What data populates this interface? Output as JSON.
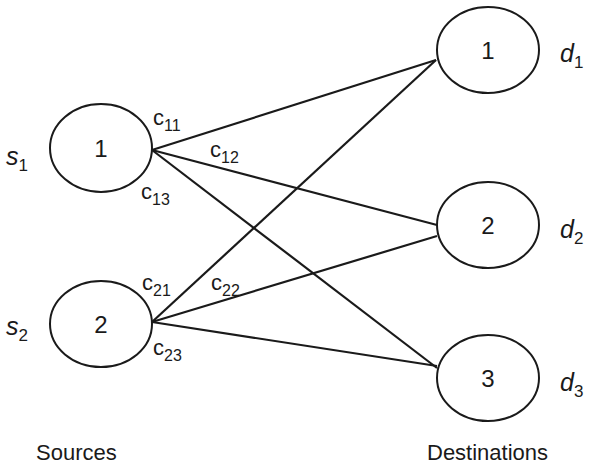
{
  "diagram": {
    "type": "transportation-network",
    "sources_caption": "Sources",
    "destinations_caption": "Destinations",
    "sources": [
      {
        "id": "1",
        "label": "1",
        "supply_symbol": "s",
        "supply_sub": "1"
      },
      {
        "id": "2",
        "label": "2",
        "supply_symbol": "s",
        "supply_sub": "2"
      }
    ],
    "destinations": [
      {
        "id": "1",
        "label": "1",
        "demand_symbol": "d",
        "demand_sub": "1"
      },
      {
        "id": "2",
        "label": "2",
        "demand_symbol": "d",
        "demand_sub": "2"
      },
      {
        "id": "3",
        "label": "3",
        "demand_symbol": "d",
        "demand_sub": "3"
      }
    ],
    "edges": [
      {
        "from": "1",
        "to": "1",
        "cost_symbol": "c",
        "cost_sub": "11"
      },
      {
        "from": "1",
        "to": "2",
        "cost_symbol": "c",
        "cost_sub": "12"
      },
      {
        "from": "1",
        "to": "3",
        "cost_symbol": "c",
        "cost_sub": "13"
      },
      {
        "from": "2",
        "to": "1",
        "cost_symbol": "c",
        "cost_sub": "21"
      },
      {
        "from": "2",
        "to": "2",
        "cost_symbol": "c",
        "cost_sub": "22"
      },
      {
        "from": "2",
        "to": "3",
        "cost_symbol": "c",
        "cost_sub": "23"
      }
    ],
    "colors": {
      "stroke": "#1a1a1a",
      "background": "#ffffff"
    }
  }
}
